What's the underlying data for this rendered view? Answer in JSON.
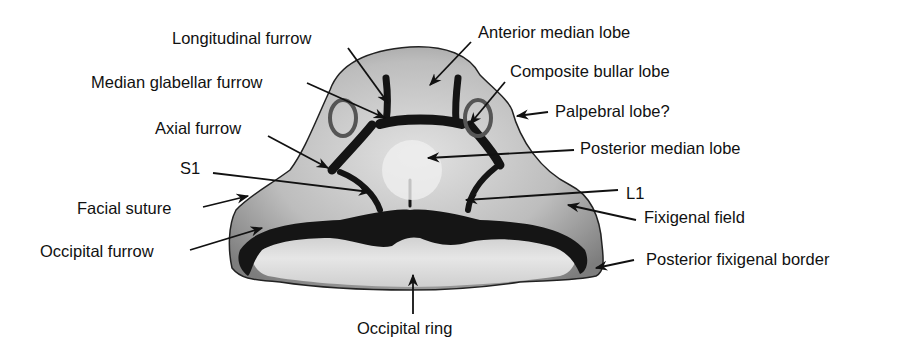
{
  "figure": {
    "colors": {
      "background": "#ffffff",
      "text": "#111111",
      "arrow": "#111111",
      "specimen_light": "#d6d6d6",
      "specimen_mid": "#9a9a9a",
      "furrow_dark": "#161616"
    }
  },
  "labels": [
    {
      "id": "longitudinal-furrow",
      "text": "Longitudinal furrow",
      "x": 172,
      "y": 30,
      "arrow": [
        348,
        48,
        388,
        103
      ]
    },
    {
      "id": "anterior-median-lobe",
      "text": "Anterior median lobe",
      "x": 478,
      "y": 24,
      "arrow": [
        471,
        42,
        430,
        85
      ]
    },
    {
      "id": "median-glabellar-furrow",
      "text": "Median glabellar furrow",
      "x": 91,
      "y": 74,
      "arrow": [
        307,
        83,
        385,
        118
      ]
    },
    {
      "id": "composite-bullar-lobe",
      "text": "Composite bullar lobe",
      "x": 510,
      "y": 63,
      "arrow": [
        505,
        82,
        470,
        124
      ]
    },
    {
      "id": "palpebral-lobe",
      "text": "Palpebral lobe?",
      "x": 555,
      "y": 103,
      "arrow": [
        548,
        112,
        517,
        116
      ]
    },
    {
      "id": "axial-furrow",
      "text": "Axial furrow",
      "x": 155,
      "y": 120,
      "arrow": [
        268,
        136,
        328,
        168
      ]
    },
    {
      "id": "posterior-median-lobe",
      "text": "Posterior median lobe",
      "x": 580,
      "y": 140,
      "arrow": [
        574,
        150,
        428,
        158
      ]
    },
    {
      "id": "s1",
      "text": "S1",
      "x": 180,
      "y": 160,
      "arrow": [
        213,
        173,
        370,
        192
      ]
    },
    {
      "id": "l1",
      "text": "L1",
      "x": 626,
      "y": 185,
      "arrow": [
        618,
        190,
        466,
        200
      ]
    },
    {
      "id": "facial-suture",
      "text": "Facial suture",
      "x": 77,
      "y": 200,
      "arrow": [
        203,
        207,
        248,
        196
      ]
    },
    {
      "id": "fixigenal-field",
      "text": "Fixigenal field",
      "x": 644,
      "y": 209,
      "arrow": [
        636,
        220,
        568,
        205
      ]
    },
    {
      "id": "occipital-furrow",
      "text": "Occipital furrow",
      "x": 40,
      "y": 243,
      "arrow": [
        190,
        250,
        262,
        228
      ]
    },
    {
      "id": "posterior-fixigenal-border",
      "text": "Posterior fixigenal border",
      "x": 646,
      "y": 251,
      "arrow": [
        634,
        260,
        596,
        268
      ]
    },
    {
      "id": "occipital-ring",
      "text": "Occipital ring",
      "x": 357,
      "y": 320,
      "arrow": [
        413,
        314,
        413,
        275
      ]
    }
  ]
}
